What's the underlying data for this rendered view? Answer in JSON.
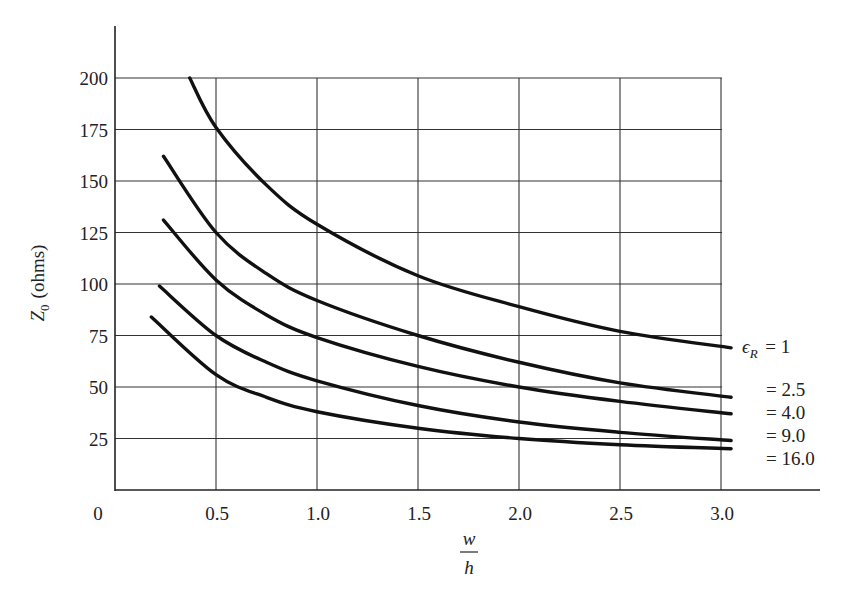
{
  "chart_data": {
    "type": "line",
    "title": "",
    "xlabel": "w/h",
    "xlabel_num": "w",
    "xlabel_den": "h",
    "ylabel": "Z0 (ohms)",
    "ylabel_main": "Z",
    "ylabel_sub": "0",
    "ylabel_unit": "(ohms)",
    "xlim": [
      0,
      3.4
    ],
    "ylim": [
      0,
      225
    ],
    "grid": true,
    "x_ticks": [
      "0",
      "0.5",
      "1.0",
      "1.5",
      "2.0",
      "2.5",
      "3.0"
    ],
    "x_tick_values": [
      0,
      0.5,
      1.0,
      1.5,
      2.0,
      2.5,
      3.0
    ],
    "y_ticks": [
      "25",
      "50",
      "75",
      "100",
      "125",
      "150",
      "175",
      "200"
    ],
    "y_tick_values": [
      25,
      50,
      75,
      100,
      125,
      150,
      175,
      200
    ],
    "legend_position": "right, inline at curve ends",
    "series": [
      {
        "name": "εR = 1",
        "label_prefix": "ϵ",
        "label_sub": "R",
        "label_text": "= 1",
        "x": [
          0.37,
          0.5,
          0.75,
          1.0,
          1.5,
          2.0,
          2.5,
          3.05
        ],
        "y": [
          200,
          176,
          148,
          129,
          104,
          89,
          77,
          69
        ]
      },
      {
        "name": "εR = 2.5",
        "label_text": "= 2.5",
        "x": [
          0.24,
          0.5,
          0.75,
          1.0,
          1.5,
          2.0,
          2.5,
          3.05
        ],
        "y": [
          162,
          125,
          105,
          92,
          75,
          62,
          52,
          45
        ]
      },
      {
        "name": "εR = 4.0",
        "label_text": "= 4.0",
        "x": [
          0.24,
          0.5,
          0.75,
          1.0,
          1.5,
          2.0,
          2.5,
          3.05
        ],
        "y": [
          131,
          102,
          85,
          74,
          60,
          50,
          43,
          37
        ]
      },
      {
        "name": "εR = 9.0",
        "label_text": "= 9.0",
        "x": [
          0.22,
          0.5,
          0.75,
          1.0,
          1.5,
          2.0,
          2.5,
          3.05
        ],
        "y": [
          99,
          75,
          62,
          53,
          41,
          33,
          28,
          24
        ]
      },
      {
        "name": "εR = 16.0",
        "label_text": "= 16.0",
        "x": [
          0.18,
          0.5,
          0.75,
          1.0,
          1.5,
          2.0,
          2.5,
          3.05
        ],
        "y": [
          84,
          56,
          45,
          38,
          30,
          25,
          22,
          20
        ]
      }
    ]
  },
  "colors": {
    "line": "#111111",
    "grid": "#333333",
    "background": "#ffffff"
  }
}
